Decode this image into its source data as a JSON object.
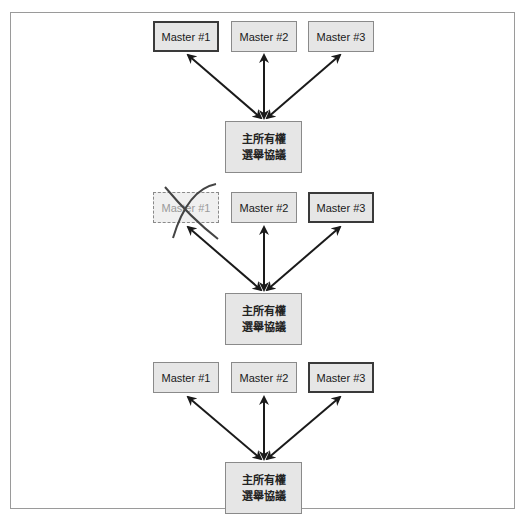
{
  "diagram": {
    "panels": [
      {
        "masters": [
          {
            "label": "Master #1",
            "state": "primary"
          },
          {
            "label": "Master #2",
            "state": "normal"
          },
          {
            "label": "Master #3",
            "state": "normal"
          }
        ],
        "protocol": {
          "line1": "主所有權",
          "line2": "選舉協議"
        }
      },
      {
        "masters": [
          {
            "label": "Master #1",
            "state": "failed"
          },
          {
            "label": "Master #2",
            "state": "normal"
          },
          {
            "label": "Master #3",
            "state": "primary"
          }
        ],
        "protocol": {
          "line1": "主所有權",
          "line2": "選舉協議"
        }
      },
      {
        "masters": [
          {
            "label": "Master #1",
            "state": "normal"
          },
          {
            "label": "Master #2",
            "state": "normal"
          },
          {
            "label": "Master #3",
            "state": "primary"
          }
        ],
        "protocol": {
          "line1": "主所有權",
          "line2": "選舉協議"
        }
      }
    ],
    "colors": {
      "box_fill": "#e6e6e6",
      "box_border": "#8a8a8a",
      "primary_border": "#3a3a3a",
      "arrow": "#1a1a1a",
      "failed_text": "#9a9a9a",
      "cross_mark": "#444444"
    }
  }
}
